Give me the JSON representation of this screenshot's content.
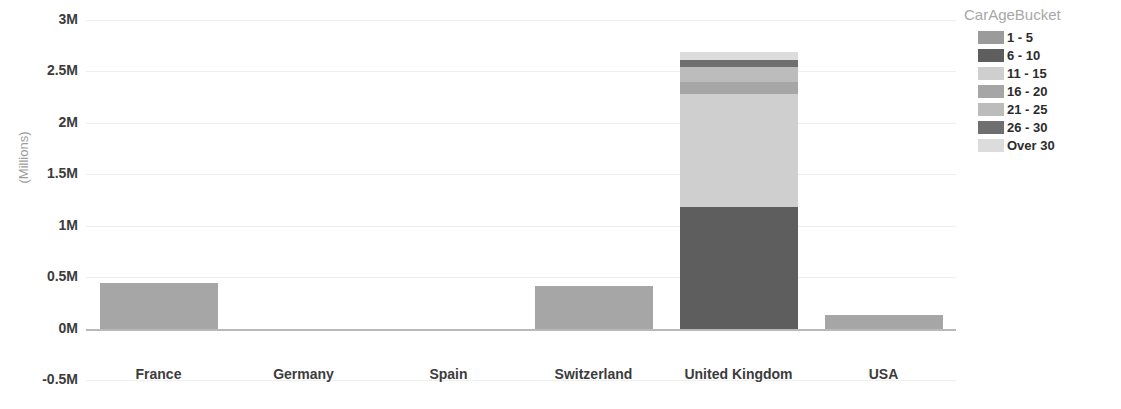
{
  "chart_data": {
    "type": "bar",
    "title": "",
    "subtitle": "",
    "xlabel": "",
    "ylabel": "(Millions)",
    "stacked": true,
    "grid": true,
    "legend_position": "right",
    "ylim": [
      -0.5,
      3
    ],
    "ytick_values": [
      3,
      2.5,
      2,
      1.5,
      1,
      0.5,
      0,
      -0.5
    ],
    "ytick_labels": [
      "3M",
      "2.5M",
      "2M",
      "1.5M",
      "1M",
      "0.5M",
      "0M",
      "-0.5M"
    ],
    "categories": [
      "France",
      "Germany",
      "Spain",
      "Switzerland",
      "United Kingdom",
      "USA"
    ],
    "series": [
      {
        "name": "1 - 5",
        "color": "#9b9b9b",
        "values": [
          0.0,
          0,
          0,
          0.0,
          0.0,
          0.0
        ]
      },
      {
        "name": "6 - 10",
        "color": "#5e5e5e",
        "values": [
          0.0,
          0,
          0,
          0.0,
          1.18,
          0.0
        ]
      },
      {
        "name": "11 - 15",
        "color": "#cfcfcf",
        "values": [
          0.0,
          0,
          0,
          0.0,
          1.1,
          0.0
        ]
      },
      {
        "name": "16 - 20",
        "color": "#a6a6a6",
        "values": [
          0.44,
          0,
          0,
          0.41,
          0.12,
          0.13
        ]
      },
      {
        "name": "21 - 25",
        "color": "#bcbcbc",
        "values": [
          0.0,
          0,
          0,
          0.0,
          0.14,
          0.0
        ]
      },
      {
        "name": "26 - 30",
        "color": "#6f6f6f",
        "values": [
          0.0,
          0,
          0,
          0.0,
          0.07,
          0.0
        ]
      },
      {
        "name": "Over 30",
        "color": "#dcdcdc",
        "values": [
          0.0,
          0,
          0,
          0.0,
          0.08,
          0.0
        ]
      }
    ],
    "totals": [
      0.44,
      0,
      0,
      0.41,
      2.69,
      0.13
    ]
  },
  "legend": {
    "title": "CarAgeBucket",
    "items": [
      {
        "label": "1 - 5",
        "color": "#9b9b9b"
      },
      {
        "label": "6 - 10",
        "color": "#5e5e5e"
      },
      {
        "label": "11 - 15",
        "color": "#cfcfcf"
      },
      {
        "label": "16 - 20",
        "color": "#a6a6a6"
      },
      {
        "label": "21 - 25",
        "color": "#bcbcbc"
      },
      {
        "label": "26 - 30",
        "color": "#6f6f6f"
      },
      {
        "label": "Over 30",
        "color": "#dcdcdc"
      }
    ]
  },
  "axes": {
    "y_title": "(Millions)",
    "y_ticks": [
      "3M",
      "2.5M",
      "2M",
      "1.5M",
      "1M",
      "0.5M",
      "0M",
      "-0.5M"
    ],
    "x_ticks": [
      "France",
      "Germany",
      "Spain",
      "Switzerland",
      "United Kingdom",
      "USA"
    ]
  },
  "colors": {
    "gridline": "#efefef",
    "zeroline": "#b9b9b9",
    "tick_text": "#3c3c3c",
    "legend_title": "#a8a8a8",
    "axis_title": "#9d9d9d"
  }
}
